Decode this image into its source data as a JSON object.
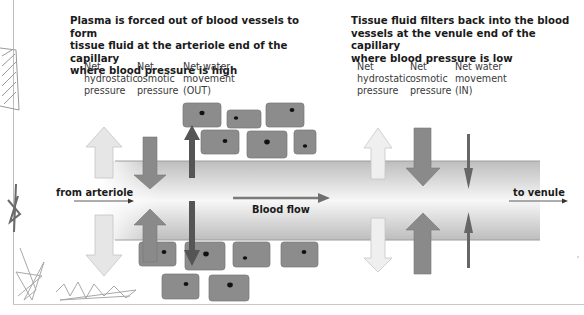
{
  "left_panel": {
    "heading_lines": [
      "Plasma is forced out of blood vessels to form",
      "tissue fluid at the arteriole end of the capillary",
      "where blood pressure is high"
    ],
    "columns": [
      {
        "lines": [
          "Net",
          "hydrostatic",
          "pressure"
        ]
      },
      {
        "lines": [
          "Net",
          "osmotic",
          "pressure"
        ]
      },
      {
        "lines": [
          "Net water",
          "movement",
          "(OUT)"
        ]
      }
    ]
  },
  "right_panel": {
    "heading_lines": [
      "Tissue fluid filters back into the blood",
      "vessels at the venule end of the capillary",
      "where blood pressure is low"
    ],
    "columns": [
      {
        "lines": [
          "Net",
          "hydrostatic",
          "pressure"
        ]
      },
      {
        "lines": [
          "Net",
          "osmotic",
          "pressure"
        ]
      },
      {
        "lines": [
          "Net water",
          "movement",
          "(IN)"
        ]
      }
    ]
  },
  "capillary": {
    "inlet_label": "from arteriole",
    "outlet_label": "to venule",
    "flow_label": "Blood flow"
  },
  "colors": {
    "cell_fill": "#8c8c8c",
    "nucleus": "#111111",
    "hydrostatic_arrow": "#e6e6e6",
    "osmotic_arrow": "#8a8a8a",
    "net_arrow": "#5a5a5a",
    "vessel_edge": "#b9b9b9",
    "vessel_center": "#f6f6f6"
  }
}
